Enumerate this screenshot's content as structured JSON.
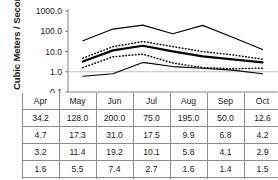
{
  "chart_data": {
    "type": "line",
    "title": "",
    "xlabel": "",
    "ylabel": "Cubic Meters / Second",
    "yscale": "log",
    "ylim": [
      0.1,
      1000.0
    ],
    "ytick_labels": [
      "1000.0",
      "100.0",
      "10.0",
      "1.0",
      "0.1"
    ],
    "ytick_values": [
      1000.0,
      100.0,
      10.0,
      1.0,
      0.1
    ],
    "grid": "horizontal-at-1.0",
    "legend": "none",
    "categories": [
      "Apr",
      "May",
      "Jun",
      "Jul",
      "Aug",
      "Sep",
      "Oct"
    ],
    "series": [
      {
        "name": "Daily Max",
        "style": "solid-thin",
        "values": [
          34.2,
          128.0,
          200.0,
          75.0,
          195.0,
          50.0,
          12.6
        ]
      },
      {
        "name": "+ 1 Std.",
        "style": "dotted",
        "values": [
          4.7,
          17.3,
          31.0,
          17.5,
          9.9,
          6.8,
          4.2
        ]
      },
      {
        "name": "Daily Mean",
        "style": "solid-thick",
        "values": [
          3.2,
          11.4,
          19.2,
          10.1,
          5.8,
          4.1,
          2.9
        ]
      },
      {
        "name": "- 1 Std.",
        "style": "dotted",
        "values": [
          1.6,
          5.5,
          7.4,
          2.7,
          1.6,
          1.4,
          1.5
        ]
      },
      {
        "name": "Daily Min.",
        "style": "solid-thin",
        "values": [
          0.6,
          0.8,
          2.9,
          1.8,
          1.5,
          1.2,
          0.8
        ]
      }
    ]
  },
  "table": {
    "columns": [
      "Apr",
      "May",
      "Jun",
      "Jul",
      "Aug",
      "Sep",
      "Oct"
    ],
    "rows": [
      {
        "label": "Daily Max",
        "cells": [
          "34.2",
          "128.0",
          "200.0",
          "75.0",
          "195.0",
          "50.0",
          "12.6"
        ]
      },
      {
        "label": "+ 1 Std.",
        "cells": [
          "4.7",
          "17.3",
          "31.0",
          "17.5",
          "9.9",
          "6.8",
          "4.2"
        ]
      },
      {
        "label": "Daily Mean",
        "cells": [
          "3.2",
          "11.4",
          "19.2",
          "10.1",
          "5.8",
          "4.1",
          "2.9"
        ]
      },
      {
        "label": "- 1 Std.",
        "cells": [
          "1.6",
          "5.5",
          "7.4",
          "2.7",
          "1.6",
          "1.4",
          "1.5"
        ]
      },
      {
        "label": "Daily Min.",
        "cells": [
          "0.6",
          "0.8",
          "2.9",
          "1.8",
          "1.5",
          "1.2",
          "0.8"
        ]
      }
    ]
  },
  "colors": {
    "line": "#000000",
    "axis": "#808080",
    "grid": "#bfbfbf",
    "border": "#8c8c8c",
    "text": "#1a1a1a",
    "background": "#ffffff"
  }
}
